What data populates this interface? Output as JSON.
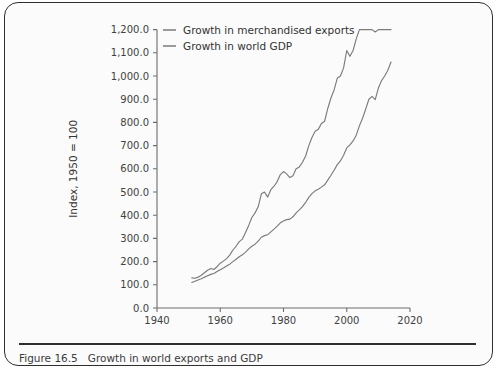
{
  "figure": {
    "number": "Figure 16.5",
    "caption": "Growth in world exports and GDP"
  },
  "chart_data": {
    "type": "line",
    "title": "",
    "xlabel": "Year",
    "ylabel": "Index, 1950 = 100",
    "xlim": [
      1940,
      2020
    ],
    "ylim": [
      0,
      1200
    ],
    "xticks": [
      1940,
      1960,
      1980,
      2000,
      2020
    ],
    "xtick_labels": [
      "1940",
      "1960",
      "1980",
      "2000",
      "2020"
    ],
    "yticks": [
      0,
      100,
      200,
      300,
      400,
      500,
      600,
      700,
      800,
      900,
      1000,
      1100,
      1200
    ],
    "ytick_labels": [
      "0.0",
      "100.0",
      "200.0",
      "300.0",
      "400.0",
      "500.0",
      "600.0",
      "700.0",
      "800.0",
      "900.0",
      "1,000.0",
      "1,100.0",
      "1,200.0"
    ],
    "grid": false,
    "legend_position": "top-center",
    "series": [
      {
        "name": "Growth in merchandised exports",
        "color": "#7b7b7b",
        "x": [
          1951,
          1952,
          1953,
          1954,
          1955,
          1956,
          1957,
          1958,
          1959,
          1960,
          1961,
          1962,
          1963,
          1964,
          1965,
          1966,
          1967,
          1968,
          1969,
          1970,
          1971,
          1972,
          1973,
          1974,
          1975,
          1976,
          1977,
          1978,
          1979,
          1980,
          1981,
          1982,
          1983,
          1984,
          1985,
          1986,
          1987,
          1988,
          1989,
          1990,
          1991,
          1992,
          1993,
          1994,
          1995,
          1996,
          1997,
          1998,
          1999,
          2000,
          2001,
          2002,
          2003,
          2004,
          2005,
          2006,
          2007,
          2008,
          2009,
          2010,
          2011,
          2012,
          2013,
          2014
        ],
        "values": [
          130,
          128,
          133,
          141,
          152,
          163,
          170,
          166,
          178,
          193,
          202,
          213,
          228,
          250,
          266,
          286,
          297,
          325,
          356,
          390,
          410,
          436,
          492,
          500,
          478,
          510,
          525,
          545,
          575,
          588,
          578,
          562,
          570,
          600,
          608,
          628,
          655,
          700,
          735,
          762,
          770,
          795,
          805,
          860,
          905,
          940,
          990,
          1000,
          1035,
          1110,
          1085,
          1110,
          1160,
          1250,
          1310,
          1400,
          1460,
          1480,
          1190,
          1390,
          1480,
          1495,
          1520,
          1545
        ]
      },
      {
        "name": "Growth in world GDP",
        "color": "#7b7b7b",
        "x": [
          1951,
          1952,
          1953,
          1954,
          1955,
          1956,
          1957,
          1958,
          1959,
          1960,
          1961,
          1962,
          1963,
          1964,
          1965,
          1966,
          1967,
          1968,
          1969,
          1970,
          1971,
          1972,
          1973,
          1974,
          1975,
          1976,
          1977,
          1978,
          1979,
          1980,
          1981,
          1982,
          1983,
          1984,
          1985,
          1986,
          1987,
          1988,
          1989,
          1990,
          1991,
          1992,
          1993,
          1994,
          1995,
          1996,
          1997,
          1998,
          1999,
          2000,
          2001,
          2002,
          2003,
          2004,
          2005,
          2006,
          2007,
          2008,
          2009,
          2010,
          2011,
          2012,
          2013,
          2014
        ],
        "values": [
          110,
          115,
          121,
          126,
          133,
          139,
          145,
          149,
          157,
          165,
          172,
          181,
          189,
          200,
          210,
          221,
          229,
          241,
          255,
          266,
          275,
          288,
          305,
          312,
          316,
          328,
          340,
          353,
          367,
          375,
          381,
          383,
          393,
          410,
          423,
          437,
          455,
          477,
          493,
          505,
          512,
          521,
          531,
          551,
          572,
          594,
          618,
          634,
          658,
          690,
          703,
          720,
          745,
          785,
          818,
          858,
          900,
          912,
          898,
          948,
          980,
          1000,
          1025,
          1060
        ]
      }
    ],
    "_note_scale": "series values are raw index points where 100 = 1950 baseline; the plotted export curve is divided by the same axis as GDP"
  },
  "legend": {
    "items": [
      {
        "label": "Growth in merchandised exports",
        "color": "#7b7b7b"
      },
      {
        "label": "Growth in world GDP",
        "color": "#7b7b7b"
      }
    ]
  },
  "colors": {
    "border": "#2f2f2f",
    "axis": "#6d6d6d",
    "text": "#333333",
    "line": "#7b7b7b",
    "background": "#fbfbfb"
  }
}
